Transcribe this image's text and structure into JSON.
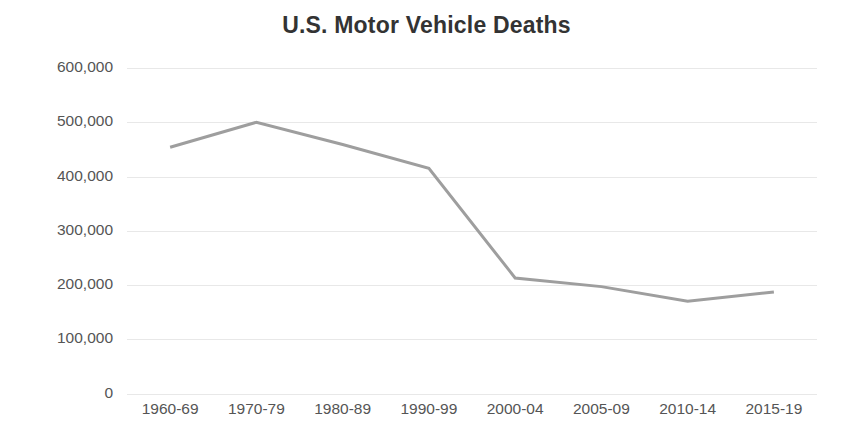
{
  "chart_data": {
    "type": "line",
    "title": "U.S. Motor Vehicle Deaths",
    "xlabel": "",
    "ylabel": "",
    "categories": [
      "1960-69",
      "1970-79",
      "1980-89",
      "1990-99",
      "2000-04",
      "2005-09",
      "2010-14",
      "2015-19"
    ],
    "values": [
      454000,
      500000,
      459000,
      415000,
      213000,
      197000,
      170000,
      187000
    ],
    "series": [
      {
        "name": "U.S. Motor Vehicle Deaths",
        "values": [
          454000,
          500000,
          459000,
          415000,
          213000,
          197000,
          170000,
          187000
        ]
      }
    ],
    "ylim": [
      0,
      600000
    ],
    "yticks": [
      0,
      100000,
      200000,
      300000,
      400000,
      500000,
      600000
    ],
    "ytick_labels": [
      "0",
      "100,000",
      "200,000",
      "300,000",
      "400,000",
      "500,000",
      "600,000"
    ],
    "grid": true,
    "grid_axis": "y",
    "legend": false,
    "legend_position": "none",
    "line_color": "#9e9e9e",
    "grid_color": "#e8e8e8",
    "title_color": "#333333",
    "tick_label_color": "#555555",
    "background_color": "#ffffff",
    "markers": false,
    "line_width": 3
  }
}
